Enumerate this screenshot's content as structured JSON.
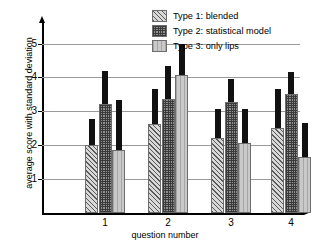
{
  "chart_data": {
    "type": "bar",
    "title": "",
    "xlabel": "question number",
    "ylabel": "average score with standard deviation",
    "categories": [
      "1",
      "2",
      "3",
      "4"
    ],
    "ylim": [
      0,
      5.4
    ],
    "yticks": [
      1,
      2,
      3,
      4,
      5
    ],
    "ytick_labels": [
      "1",
      "2",
      "3",
      "4",
      "5"
    ],
    "grid": true,
    "legend_position": "top-right",
    "error_bar_style": "upper-only-filled-black",
    "series": [
      {
        "name": "Type 1: blended",
        "fill": "diagonal-hatch",
        "color": "#d8d8d8",
        "values": [
          2.0,
          2.63,
          2.2,
          2.5
        ],
        "err_upper": [
          0.78,
          1.02,
          0.87,
          1.15
        ],
        "tops": [
          2.78,
          3.65,
          3.07,
          3.65
        ]
      },
      {
        "name": "Type 2: statistical model",
        "fill": "dense-cross-hatch",
        "color": "#8f8f8f",
        "values": [
          3.22,
          3.35,
          3.28,
          3.5
        ],
        "err_upper": [
          0.98,
          1.0,
          0.67,
          0.65
        ],
        "tops": [
          4.2,
          4.35,
          3.95,
          4.15
        ]
      },
      {
        "name": "Type 3: only lips",
        "fill": "vertical-lines",
        "color": "#c9c9c9",
        "values": [
          1.87,
          4.08,
          2.07,
          1.65
        ],
        "err_upper": [
          1.48,
          0.92,
          1.0,
          1.0
        ],
        "tops": [
          3.35,
          5.0,
          3.07,
          2.65
        ]
      }
    ]
  },
  "axes": {
    "ylabel": "average score with standard deviation",
    "xlabel": "question number",
    "ytick_labels": [
      "5",
      "4",
      "3",
      "2",
      "1"
    ],
    "xtick_labels": [
      "1",
      "2",
      "3",
      "4"
    ]
  },
  "legend": {
    "items": [
      {
        "label": "Type 1: blended"
      },
      {
        "label": "Type 2: statistical model"
      },
      {
        "label": "Type 3: only lips"
      }
    ]
  }
}
